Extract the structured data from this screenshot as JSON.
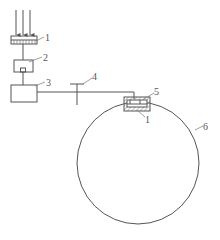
{
  "diagram": {
    "type": "schematic",
    "stroke_color": "#555555",
    "labels": {
      "light_source_element": "1",
      "box_2": "2",
      "box_3": "3",
      "valve": "4",
      "sensor_housing": "5",
      "sensor_element": "1",
      "ring": "6"
    },
    "components": [
      {
        "id": "incident-arrows",
        "count": 3
      },
      {
        "id": "element-1-top",
        "label": "1"
      },
      {
        "id": "component-2",
        "label": "2"
      },
      {
        "id": "component-3",
        "label": "3"
      },
      {
        "id": "valve-4",
        "label": "4"
      },
      {
        "id": "housing-5",
        "label": "5"
      },
      {
        "id": "element-1-bottom",
        "label": "1"
      },
      {
        "id": "ring-6",
        "label": "6"
      }
    ]
  }
}
